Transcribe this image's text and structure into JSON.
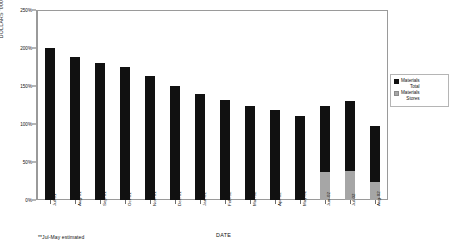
{
  "chart_data": {
    "type": "bar",
    "title": "",
    "xlabel": "DATE",
    "ylabel": "DOLLARS '000",
    "ylim": [
      0,
      250
    ],
    "ytick_labels": [
      "250%",
      "200%",
      "150%",
      "100%",
      "50%",
      "0%"
    ],
    "ytick_values": [
      250,
      200,
      150,
      100,
      50,
      0
    ],
    "grid": false,
    "stacked": true,
    "legend_position": "right",
    "categories": [
      "Jul-01",
      "Aug-01",
      "Sep-01",
      "Oct-01",
      "Nov-01",
      "Dec-01",
      "Jan-02",
      "Feb-02",
      "Mar-02",
      "Apr-02",
      "May-02",
      "Jun-02",
      "Jul-02",
      "Aug-02"
    ],
    "series": [
      {
        "name": "Materials Stores",
        "color": "#a6a6a6",
        "values": [
          0,
          0,
          0,
          0,
          0,
          0,
          0,
          0,
          0,
          0,
          0,
          37,
          38,
          24
        ]
      },
      {
        "name": "Materials Total",
        "color": "#111111",
        "values": [
          200,
          188,
          180,
          175,
          163,
          150,
          140,
          132,
          124,
          118,
          110,
          87,
          92,
          74
        ]
      }
    ],
    "totals": [
      200,
      188,
      180,
      175,
      163,
      150,
      140,
      132,
      124,
      118,
      110,
      124,
      130,
      98
    ],
    "annotations": [
      "**Jul-May estimated"
    ]
  },
  "legend": {
    "entries": [
      {
        "line1": "Materials",
        "line2": "Total",
        "swatch": "black-square-icon"
      },
      {
        "line1": "Materials",
        "line2": "Stores",
        "swatch": "gray-square-icon"
      }
    ]
  },
  "footnote": "**Jul-May estimated"
}
